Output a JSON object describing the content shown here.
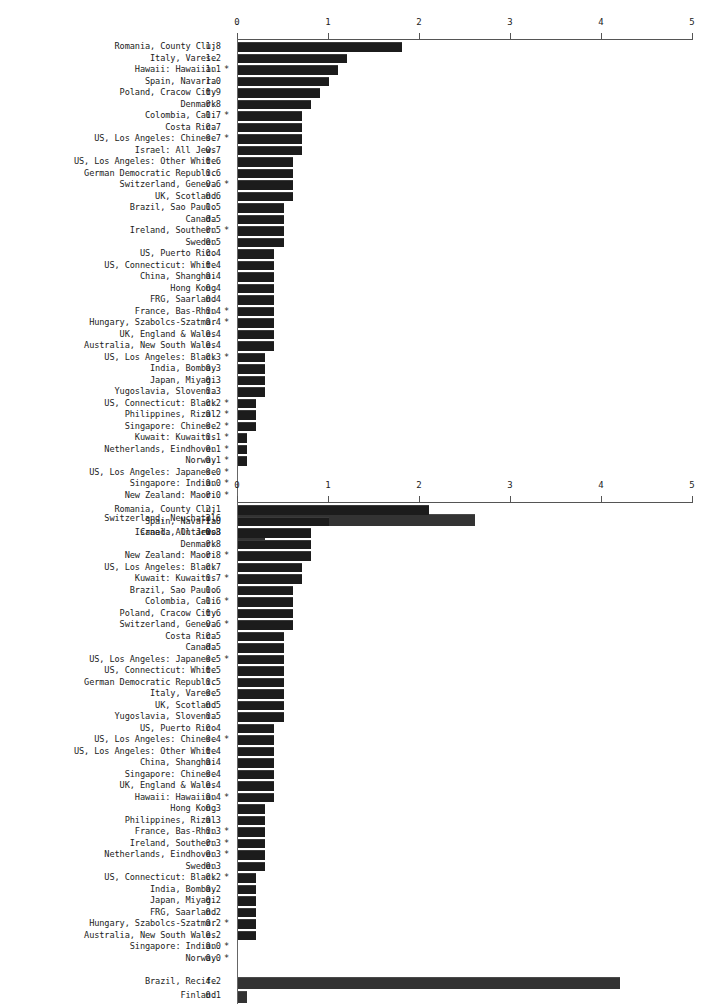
{
  "chart_data": [
    {
      "type": "bar",
      "orientation": "horizontal",
      "title": "",
      "xlabel": "",
      "ylabel": "",
      "xlim": [
        0,
        5
      ],
      "xticks": [
        "0",
        "1",
        "2",
        "3",
        "4",
        "5"
      ],
      "grid": false,
      "categories": [
        "Romania, County Cluj",
        "Italy, Varese",
        "Hawaii: Hawaiian",
        "Spain, Navarra",
        "Poland, Cracow City",
        "Denmark",
        "Colombia, Cali",
        "Costa Rica",
        "US, Los Angeles: Chinese",
        "Israel: All Jews",
        "US, Los Angeles: Other White",
        "German Democratic Republic",
        "Switzerland, Geneva",
        "UK, Scotland",
        "Brazil, Sao Paulo",
        "Canada",
        "Ireland, Southern",
        "Sweden",
        "US, Puerto Rico",
        "US, Connecticut: White",
        "China, Shanghai",
        "Hong Kong",
        "FRG, Saarland",
        "France, Bas-Rhin",
        "Hungary, Szabolcs-Szatmar",
        "UK, England & Wales",
        "Australia, New South Wales",
        "US, Los Angeles: Black",
        "India, Bombay",
        "Japan, Miyagi",
        "Yugoslavia, Slovenia",
        "US, Connecticut: Black",
        "Philippines, Rizal",
        "Singapore: Chinese",
        "Kuwait: Kuwaitis",
        "Netherlands, Eindhoven",
        "Norway",
        "US, Los Angeles: Japanese",
        "Singapore: Indian",
        "New Zealand: Maori"
      ],
      "values": [
        1.8,
        1.2,
        1.1,
        1.0,
        0.9,
        0.8,
        0.7,
        0.7,
        0.7,
        0.7,
        0.6,
        0.6,
        0.6,
        0.6,
        0.5,
        0.5,
        0.5,
        0.5,
        0.4,
        0.4,
        0.4,
        0.4,
        0.4,
        0.4,
        0.4,
        0.4,
        0.4,
        0.3,
        0.3,
        0.3,
        0.3,
        0.2,
        0.2,
        0.2,
        0.1,
        0.1,
        0.1,
        0.0,
        0.0,
        0.0
      ],
      "value_labels": [
        "1.8",
        "1.2",
        "1.1",
        "1.0",
        "0.9",
        "0.8",
        "0.7",
        "0.7",
        "0.7",
        "0.7",
        "0.6",
        "0.6",
        "0.6",
        "0.6",
        "0.5",
        "0.5",
        "0.5",
        "0.5",
        "0.4",
        "0.4",
        "0.4",
        "0.4",
        "0.4",
        "0.4",
        "0.4",
        "0.4",
        "0.4",
        "0.3",
        "0.3",
        "0.3",
        "0.3",
        "0.2",
        "0.2",
        "0.2",
        "0.1",
        "0.1",
        "0.1",
        "0.0",
        "0.0",
        "0.0"
      ],
      "flags": [
        "",
        "",
        "*",
        "",
        "",
        "",
        "*",
        "",
        "*",
        "",
        "",
        "",
        "*",
        "",
        "",
        "",
        "*",
        "",
        "",
        "",
        "",
        "",
        "",
        "*",
        "*",
        "",
        "",
        "*",
        "",
        "",
        "",
        "*",
        "*",
        "*",
        "*",
        "*",
        "*",
        "*",
        "*",
        "*"
      ],
      "extra_categories": [
        "Switzerland, Neuchatel",
        "Canada, Ontario"
      ],
      "extra_values": [
        2.6,
        0.3
      ],
      "extra_value_labels": [
        "2.6",
        "0.3"
      ],
      "extra_flags": [
        "",
        ""
      ]
    },
    {
      "type": "bar",
      "orientation": "horizontal",
      "title": "",
      "xlabel": "",
      "ylabel": "",
      "xlim": [
        0,
        5
      ],
      "xticks": [
        "0",
        "1",
        "2",
        "3",
        "4",
        "5"
      ],
      "grid": false,
      "categories": [
        "Romania, County Cluj",
        "Spain, Navarra",
        "Israel: All Jews",
        "Denmark",
        "New Zealand: Maori",
        "US, Los Angeles: Black",
        "Kuwait: Kuwaitis",
        "Brazil, Sao Paulo",
        "Colombia, Cali",
        "Poland, Cracow City",
        "Switzerland, Geneva",
        "Costa Rica",
        "Canada",
        "US, Los Angeles: Japanese",
        "US, Connecticut: White",
        "German Democratic Republic",
        "Italy, Varese",
        "UK, Scotland",
        "Yugoslavia, Slovenia",
        "US, Puerto Rico",
        "US, Los Angeles: Chinese",
        "US, Los Angeles: Other White",
        "China, Shanghai",
        "Singapore: Chinese",
        "UK, England & Wales",
        "Hawaii: Hawaiian",
        "Hong Kong",
        "Philippines, Rizal",
        "France, Bas-Rhin",
        "Ireland, Southern",
        "Netherlands, Eindhoven",
        "Sweden",
        "US, Connecticut: Black",
        "India, Bombay",
        "Japan, Miyagi",
        "FRG, Saarland",
        "Hungary, Szabolcs-Szatmar",
        "Australia, New South Wales",
        "Singapore: Indian",
        "Norway"
      ],
      "values": [
        2.1,
        1.0,
        0.8,
        0.8,
        0.8,
        0.7,
        0.7,
        0.6,
        0.6,
        0.6,
        0.6,
        0.5,
        0.5,
        0.5,
        0.5,
        0.5,
        0.5,
        0.5,
        0.5,
        0.4,
        0.4,
        0.4,
        0.4,
        0.4,
        0.4,
        0.4,
        0.3,
        0.3,
        0.3,
        0.3,
        0.3,
        0.3,
        0.2,
        0.2,
        0.2,
        0.2,
        0.2,
        0.2,
        0.0,
        0.0
      ],
      "value_labels": [
        "2.1",
        "1.0",
        "0.8",
        "0.8",
        "0.8",
        "0.7",
        "0.7",
        "0.6",
        "0.6",
        "0.6",
        "0.6",
        "0.5",
        "0.5",
        "0.5",
        "0.5",
        "0.5",
        "0.5",
        "0.5",
        "0.5",
        "0.4",
        "0.4",
        "0.4",
        "0.4",
        "0.4",
        "0.4",
        "0.4",
        "0.3",
        "0.3",
        "0.3",
        "0.3",
        "0.3",
        "0.3",
        "0.2",
        "0.2",
        "0.2",
        "0.2",
        "0.2",
        "0.2",
        "0.0",
        "0.0"
      ],
      "flags": [
        "",
        "",
        "",
        "",
        "*",
        "",
        "*",
        "",
        "*",
        "",
        "*",
        "",
        "",
        "*",
        "",
        "",
        "",
        "",
        "",
        "",
        "*",
        "",
        "",
        "",
        "",
        "*",
        "",
        "",
        "*",
        "*",
        "*",
        "",
        "*",
        "",
        "",
        "",
        "*",
        "",
        "*",
        "*"
      ],
      "extra_categories": [
        "Brazil, Recife",
        "Finland"
      ],
      "extra_values": [
        4.2,
        0.1
      ],
      "extra_value_labels": [
        "4.2",
        "0.1"
      ],
      "extra_flags": [
        "",
        ""
      ]
    }
  ]
}
